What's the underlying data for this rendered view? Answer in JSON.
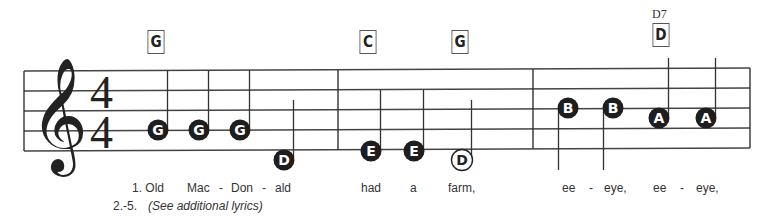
{
  "song": {
    "clef": "treble",
    "time_signature": {
      "top": "4",
      "bottom": "4"
    }
  },
  "chords": [
    {
      "name": "G",
      "x": 146,
      "y": 30
    },
    {
      "name": "C",
      "x": 358,
      "y": 30
    },
    {
      "name": "G",
      "x": 450,
      "y": 30
    },
    {
      "name": "D",
      "x": 651,
      "y": 23,
      "label": "D7"
    }
  ],
  "notes": [
    {
      "letter": "G",
      "x": 158,
      "y": 130,
      "filled": true,
      "stem": "up",
      "stem_top": 70
    },
    {
      "letter": "G",
      "x": 199,
      "y": 130,
      "filled": true,
      "stem": "up",
      "stem_top": 70
    },
    {
      "letter": "G",
      "x": 240,
      "y": 130,
      "filled": true,
      "stem": "up",
      "stem_top": 70
    },
    {
      "letter": "D",
      "x": 284,
      "y": 160,
      "filled": true,
      "stem": "up",
      "stem_top": 100
    },
    {
      "letter": "E",
      "x": 371,
      "y": 151,
      "filled": true,
      "stem": "up",
      "stem_top": 90
    },
    {
      "letter": "E",
      "x": 414,
      "y": 151,
      "filled": true,
      "stem": "up",
      "stem_top": 90
    },
    {
      "letter": "D",
      "x": 462,
      "y": 160,
      "filled": false,
      "stem": "up",
      "stem_top": 100
    },
    {
      "letter": "B",
      "x": 568,
      "y": 108,
      "filled": true,
      "stem": "down",
      "stem_bottom": 170
    },
    {
      "letter": "B",
      "x": 613,
      "y": 108,
      "filled": true,
      "stem": "down",
      "stem_bottom": 170
    },
    {
      "letter": "A",
      "x": 659,
      "y": 118,
      "filled": true,
      "stem": "up",
      "stem_top": 58
    },
    {
      "letter": "A",
      "x": 706,
      "y": 118,
      "filled": true,
      "stem": "up",
      "stem_top": 58
    }
  ],
  "lyrics": {
    "verse1": [
      {
        "text": "1. Old",
        "x": 132
      },
      {
        "text": "Mac",
        "x": 187
      },
      {
        "text": "-",
        "x": 219
      },
      {
        "text": "Don",
        "x": 231
      },
      {
        "text": "-",
        "x": 262
      },
      {
        "text": "ald",
        "x": 275
      },
      {
        "text": "had",
        "x": 361
      },
      {
        "text": "a",
        "x": 410
      },
      {
        "text": "farm,",
        "x": 448
      },
      {
        "text": "ee",
        "x": 562
      },
      {
        "text": "-",
        "x": 589
      },
      {
        "text": "eye,",
        "x": 604
      },
      {
        "text": "ee",
        "x": 653
      },
      {
        "text": "-",
        "x": 680
      },
      {
        "text": "eye,",
        "x": 696
      }
    ],
    "verse2_5_number": "2.-5.",
    "verse2_5_text": "(See additional lyrics)"
  },
  "colors": {
    "ink": "#222222",
    "staff": "#444444",
    "paper": "#ffffff"
  }
}
